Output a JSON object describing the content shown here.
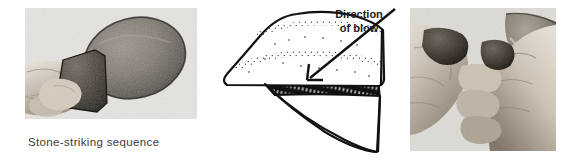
{
  "figure": {
    "caption": "Stone-striking sequence",
    "background_color": "#ffffff",
    "text_color": "#3b3b3b"
  },
  "panels": [
    {
      "name": "photo-left",
      "kind": "photograph",
      "description": "Hand holding a dark angular hammerstone beside a large oval cobble",
      "objects": [
        "hand",
        "dark hammerstone",
        "oval cobble core"
      ]
    },
    {
      "name": "diagram-middle",
      "kind": "line-drawing",
      "description": "Schematic of a core with a flake being detached, stippled cortex surface and hatched striking platform",
      "objects": [
        "core",
        "flake",
        "striking platform",
        "stippled surface"
      ]
    },
    {
      "name": "photo-right",
      "kind": "photograph",
      "description": "Two hands holding small detached stone flakes with a large rounded cobble behind",
      "objects": [
        "left hand with flake",
        "right hand with flake",
        "rounded cobble"
      ]
    }
  ],
  "annotation": {
    "label_line_1": "Direction",
    "label_line_2": "of blow",
    "arrow": {
      "name": "direction-of-blow-arrow",
      "from_x": 395,
      "from_y": 9,
      "to_x": 307,
      "to_y": 80,
      "color": "#111111"
    }
  }
}
